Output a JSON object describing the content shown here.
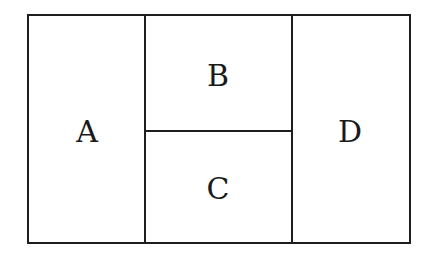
{
  "diagram": {
    "regions": [
      {
        "id": "A",
        "label": "A"
      },
      {
        "id": "B",
        "label": "B"
      },
      {
        "id": "C",
        "label": "C"
      },
      {
        "id": "D",
        "label": "D"
      }
    ],
    "line_color": "#1e1e1e",
    "background": "#ffffff"
  }
}
